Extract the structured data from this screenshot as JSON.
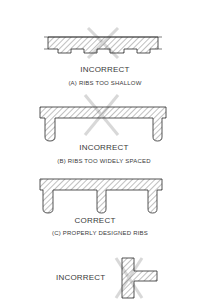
{
  "figure": {
    "panels": [
      {
        "id": "a",
        "status": "INCORRECT",
        "caption": "(A) RIBS TOO SHALLOW"
      },
      {
        "id": "b",
        "status": "INCORRECT",
        "caption": "(B) RIBS TOO WIDELY SPACED"
      },
      {
        "id": "c",
        "status": "CORRECT",
        "caption": "(C) PROPERLY DESIGNED RIBS"
      },
      {
        "id": "d",
        "status": "INCORRECT",
        "caption": ""
      }
    ],
    "colors": {
      "line": "#2a2a2a",
      "hatch": "#4a4a4a",
      "cross_mark": "#d0d0d0",
      "text": "#3a3a3a"
    }
  }
}
